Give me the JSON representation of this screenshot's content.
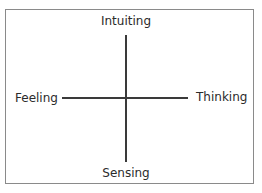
{
  "diagram": {
    "type": "quadrant-axes",
    "axes": {
      "vertical": {
        "top_label": "Intuiting",
        "bottom_label": "Sensing"
      },
      "horizontal": {
        "left_label": "Feeling",
        "right_label": "Thinking"
      }
    },
    "colors": {
      "line": "#3a3a3a",
      "frame": "#8a8a8a",
      "text": "#2b2b2b",
      "background": "#ffffff"
    }
  }
}
